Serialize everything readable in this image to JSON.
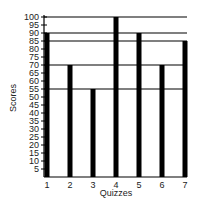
{
  "chart_data": {
    "type": "bar",
    "title": "",
    "xlabel": "Quizzes",
    "ylabel": "Scores",
    "categories": [
      "1",
      "2",
      "3",
      "4",
      "5",
      "6",
      "7"
    ],
    "values": [
      90,
      70,
      55,
      100,
      90,
      70,
      85
    ],
    "ylim": [
      0,
      100
    ],
    "yticks": [
      5,
      10,
      15,
      20,
      25,
      30,
      35,
      40,
      45,
      50,
      55,
      60,
      65,
      70,
      75,
      80,
      85,
      90,
      95,
      100
    ],
    "reference_lines": [
      100,
      90,
      85,
      70,
      55
    ],
    "grid": false,
    "legend": null,
    "bar_color": "#000000"
  }
}
